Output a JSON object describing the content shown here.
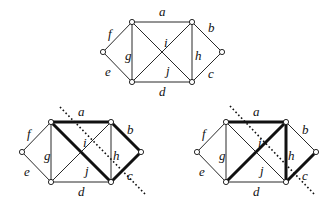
{
  "graphs": [
    {
      "id": "original",
      "offset": [
        0,
        0
      ],
      "thick_edges": [],
      "cut_line": null,
      "labels": {
        "a": "a",
        "b": "b",
        "c": "c",
        "d": "d",
        "e": "e",
        "f": "f",
        "g": "g",
        "h": "h",
        "i": "i",
        "j": "j"
      }
    },
    {
      "id": "cut-1",
      "thick_edges": [
        "a",
        "j",
        "b",
        "c"
      ],
      "cut_line": true,
      "labels": {
        "a": "a",
        "b": "b",
        "c": "c",
        "d": "d",
        "e": "e",
        "f": "f",
        "g": "g",
        "h": "h",
        "i": "i",
        "j": "j"
      }
    },
    {
      "id": "cut-2",
      "thick_edges": [
        "a",
        "i",
        "h",
        "c"
      ],
      "cut_line": true,
      "labels": {
        "a": "a",
        "b": "b",
        "c": "c",
        "d": "d",
        "e": "e",
        "f": "f",
        "g": "g",
        "h": "h",
        "i": "i",
        "j": "j"
      }
    }
  ],
  "edge_names": [
    "a",
    "b",
    "c",
    "d",
    "e",
    "f",
    "g",
    "h",
    "i",
    "j"
  ]
}
